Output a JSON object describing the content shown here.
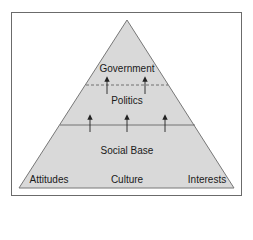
{
  "diagram": {
    "type": "pyramid",
    "colors": {
      "fill": "#d9d9d9",
      "stroke": "#777777",
      "frame": "#6b6b6b",
      "arrow": "#222222",
      "text": "#1a1a1a"
    },
    "tiers": [
      {
        "label": "Government",
        "position": "top"
      },
      {
        "label": "Politics",
        "position": "middle"
      },
      {
        "label": "Social Base",
        "position": "bottom"
      }
    ],
    "base_components": [
      "Attitudes",
      "Culture",
      "Interests"
    ],
    "dividers": [
      {
        "between": [
          "Government",
          "Politics"
        ],
        "style": "dashed",
        "arrows_up": 2
      },
      {
        "between": [
          "Politics",
          "Social Base"
        ],
        "style": "solid",
        "arrows_up": 3
      }
    ]
  }
}
